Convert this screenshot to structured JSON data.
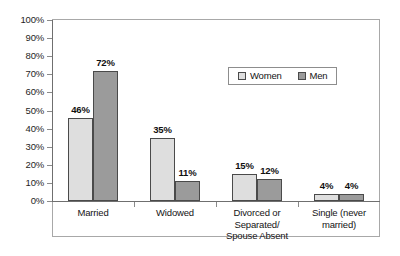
{
  "chart_data": {
    "type": "bar",
    "title": "",
    "subtitle": "",
    "xlabel": "",
    "ylabel": "",
    "ylim": [
      0,
      100
    ],
    "y_unit": "%",
    "grid": false,
    "legend_position": "inside-top-right",
    "categories": [
      "Married",
      "Widowed",
      "Divorced or\nSeparated/\nSpouse Absent",
      "Single (never\nmarried)"
    ],
    "category_lines": [
      [
        "Married"
      ],
      [
        "Widowed"
      ],
      [
        "Divorced or",
        "Separated/",
        "Spouse Absent"
      ],
      [
        "Single (never",
        "married)"
      ]
    ],
    "series": [
      {
        "name": "Women",
        "color": "#dedede",
        "values": [
          46,
          35,
          15,
          4
        ],
        "labels": [
          "46%",
          "35%",
          "15%",
          "4%"
        ]
      },
      {
        "name": "Men",
        "color": "#9b9b9b",
        "values": [
          72,
          11,
          12,
          4
        ],
        "labels": [
          "72%",
          "11%",
          "12%",
          "4%"
        ]
      }
    ],
    "y_ticks": [
      0,
      10,
      20,
      30,
      40,
      50,
      60,
      70,
      80,
      90,
      100
    ],
    "y_tick_labels": [
      "0%",
      "10%",
      "20%",
      "30%",
      "40%",
      "50%",
      "60%",
      "70%",
      "80%",
      "90%",
      "100%"
    ]
  },
  "legend": {
    "items": [
      {
        "label": "Women",
        "swatch": "women"
      },
      {
        "label": "Men",
        "swatch": "men"
      }
    ]
  }
}
